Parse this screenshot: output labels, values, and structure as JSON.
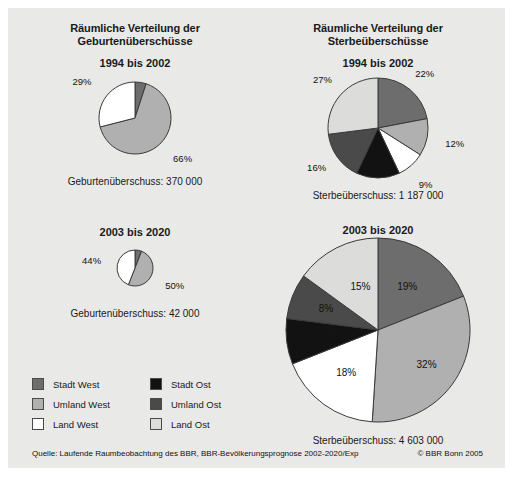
{
  "figure": {
    "background": "#e9e9e7",
    "source": "Quelle: Laufende Raumbeobachtung des BBR, BBR-Bevölkerungsprognose 2002-2020/Exp",
    "copyright": "© BBR Bonn 2005"
  },
  "legend": {
    "items": [
      {
        "label": "Stadt West",
        "color": "#6d6d6d"
      },
      {
        "label": "Umland West",
        "color": "#b0b0b0"
      },
      {
        "label": "Land West",
        "color": "#ffffff"
      },
      {
        "label": "Stadt Ost",
        "color": "#121212"
      },
      {
        "label": "Umland Ost",
        "color": "#4a4a4a"
      },
      {
        "label": "Land Ost",
        "color": "#dcdcda"
      }
    ]
  },
  "panels": {
    "births": {
      "title_line1": "Räumliche Verteilung der",
      "title_line2": "Geburtenüberschüsse",
      "period1": "1994 bis 2002",
      "caption1": "Geburtenüberschuss: 370 000",
      "period2": "2003 bis 2020",
      "caption2": "Geburtenüberschuss: 42 000"
    },
    "deaths": {
      "title_line1": "Räumliche Verteilung der",
      "title_line2": "Sterbeüberschüsse",
      "period1": "1994 bis 2002",
      "caption1": "Sterbeüberschuss: 1 187 000",
      "period2": "2003 bis 2020",
      "caption2": "Sterbeüberschuss: 4 603 000"
    }
  },
  "chart_data": [
    {
      "type": "pie",
      "id": "births-1994-2002",
      "title": "Räumliche Verteilung der Geburtenüberschüsse 1994 bis 2002",
      "total_label": "Geburtenüberschuss: 370 000",
      "categories": [
        "Stadt West",
        "Umland West",
        "Land West"
      ],
      "values": [
        5,
        66,
        29
      ],
      "labels": [
        "5%",
        "66%",
        "29%"
      ],
      "colors": [
        "#6d6d6d",
        "#b0b0b0",
        "#ffffff"
      ],
      "start_angle_deg": 0,
      "legend": "shared"
    },
    {
      "type": "pie",
      "id": "births-2003-2020",
      "title": "Räumliche Verteilung der Geburtenüberschüsse 2003 bis 2020",
      "total_label": "Geburtenüberschuss: 42 000",
      "categories": [
        "Stadt West",
        "Umland West",
        "Land West"
      ],
      "values": [
        6,
        50,
        44
      ],
      "labels": [
        "6%",
        "50%",
        "44%"
      ],
      "colors": [
        "#6d6d6d",
        "#b0b0b0",
        "#ffffff"
      ],
      "start_angle_deg": 0,
      "legend": "shared"
    },
    {
      "type": "pie",
      "id": "deaths-1994-2002",
      "title": "Räumliche Verteilung der Sterbeüberschüsse 1994 bis 2002",
      "total_label": "Sterbeüberschuss: 1 187 000",
      "categories": [
        "Stadt West",
        "Umland West",
        "Land West",
        "Stadt Ost",
        "Umland Ost",
        "Land Ost"
      ],
      "values": [
        22,
        12,
        9,
        14,
        16,
        27
      ],
      "labels": [
        "22%",
        "12%",
        "9%",
        "14%",
        "16%",
        "27%"
      ],
      "colors": [
        "#6d6d6d",
        "#b0b0b0",
        "#ffffff",
        "#121212",
        "#4a4a4a",
        "#dcdcda"
      ],
      "start_angle_deg": 0,
      "legend": "shared"
    },
    {
      "type": "pie",
      "id": "deaths-2003-2020",
      "title": "Räumliche Verteilung der Sterbeüberschüsse 2003 bis 2020",
      "total_label": "Sterbeüberschuss: 4 603 000",
      "categories": [
        "Stadt West",
        "Umland West",
        "Land West",
        "Stadt Ost",
        "Umland Ost",
        "Land Ost"
      ],
      "values": [
        19,
        32,
        18,
        8,
        8,
        15
      ],
      "labels": [
        "19%",
        "32%",
        "18%",
        "8%",
        "8%",
        "15%"
      ],
      "colors": [
        "#6d6d6d",
        "#b0b0b0",
        "#ffffff",
        "#121212",
        "#4a4a4a",
        "#dcdcda"
      ],
      "start_angle_deg": 0,
      "legend": "shared"
    }
  ]
}
